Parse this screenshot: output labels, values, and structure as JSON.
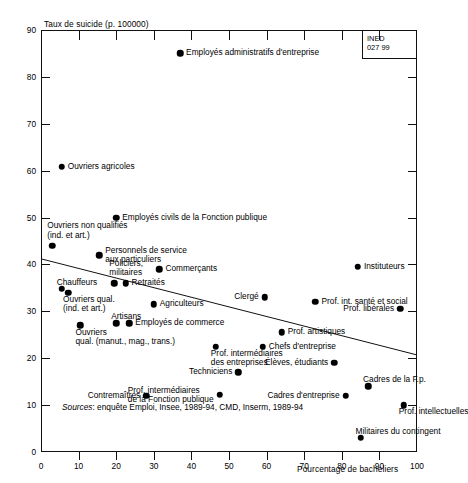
{
  "chart_data": {
    "type": "scatter",
    "title": "",
    "ylabel": "Taux de suicide (p. 100000)",
    "xlabel": "Pourcentage de bacheliers",
    "xlim": [
      0,
      100
    ],
    "ylim": [
      0,
      90
    ],
    "xticks": [
      0,
      10,
      20,
      30,
      40,
      50,
      60,
      70,
      80,
      90,
      100
    ],
    "yticks": [
      0,
      10,
      20,
      30,
      40,
      50,
      60,
      70,
      80,
      90
    ],
    "grid": false,
    "legend": null,
    "source": "Sources : enquête Emploi, Insee, 1989-94, CMD, Inserm, 1989-94",
    "source_prefix": "Sources",
    "source_rest": ": enquête Emploi, Insee, 1989-94, CMD, Inserm, 1989-94",
    "stamp": "INED\n027 99",
    "trend": {
      "x0": 0,
      "y0": 41.2,
      "x1": 100,
      "y1": 20.7
    },
    "points": [
      {
        "label": "Employés administratifs d'entreprise",
        "x": 37.0,
        "y": 85.0,
        "side": "right"
      },
      {
        "label": "Ouvriers agricoles",
        "x": 5.5,
        "y": 60.8,
        "side": "right"
      },
      {
        "label": "Employés civils de la Fonction publique",
        "x": 20.0,
        "y": 50.0,
        "side": "right"
      },
      {
        "label": "Ouvriers non qualifiés\n(ind. et art.)",
        "x": 3.0,
        "y": 44.0,
        "side": "above-left"
      },
      {
        "label": "Personnels de service\naux particuliers",
        "x": 15.5,
        "y": 42.0,
        "side": "right"
      },
      {
        "label": "Commerçants",
        "x": 31.5,
        "y": 39.0,
        "side": "right"
      },
      {
        "label": "Instituteurs",
        "x": 84.3,
        "y": 39.5,
        "side": "right"
      },
      {
        "label": "Policiers,\nmilitaires",
        "x": 19.5,
        "y": 36.0,
        "side": "above-left"
      },
      {
        "label": "Retraités",
        "x": 22.5,
        "y": 36.0,
        "side": "right"
      },
      {
        "label": "Clergé",
        "x": 59.5,
        "y": 33.0,
        "side": "left"
      },
      {
        "label": "Prof. int. santé et social",
        "x": 73.0,
        "y": 32.0,
        "side": "right"
      },
      {
        "label": "Chauffeurs",
        "x": 5.5,
        "y": 34.8,
        "side": "above-left"
      },
      {
        "label": "Ouvriers qual.\n(ind. et art.)",
        "x": 7.2,
        "y": 34.0,
        "side": "below-left"
      },
      {
        "label": "Prof. libérales",
        "x": 95.5,
        "y": 30.5,
        "side": "left"
      },
      {
        "label": "Agriculteurs",
        "x": 30.0,
        "y": 31.5,
        "side": "right"
      },
      {
        "label": "Artisans",
        "x": 20.0,
        "y": 27.5,
        "side": "above-left"
      },
      {
        "label": "Employés de commerce",
        "x": 23.5,
        "y": 27.5,
        "side": "right"
      },
      {
        "label": "Ouvriers\nqual. (manut., mag., trans.)",
        "x": 10.5,
        "y": 27.0,
        "side": "below-left"
      },
      {
        "label": "Prof. artistiques",
        "x": 64.0,
        "y": 25.5,
        "side": "right"
      },
      {
        "label": "Prof. intermédiaires\ndes entreprises",
        "x": 46.5,
        "y": 22.5,
        "side": "below"
      },
      {
        "label": "Chefs d'entreprise",
        "x": 59.0,
        "y": 22.5,
        "side": "right"
      },
      {
        "label": "Élèves, étudiants",
        "x": 78.0,
        "y": 19.0,
        "side": "left"
      },
      {
        "label": "Techniciens",
        "x": 52.5,
        "y": 17.0,
        "side": "left"
      },
      {
        "label": "Cadres de la F.p.",
        "x": 87.0,
        "y": 14.0,
        "side": "above-left"
      },
      {
        "label": "Prof. intermédiaires\nde la Fonction publique",
        "x": 47.5,
        "y": 12.2,
        "side": "left"
      },
      {
        "label": "Contremaîtres",
        "x": 28.0,
        "y": 12.0,
        "side": "left"
      },
      {
        "label": "Cadres d'entreprise",
        "x": 81.0,
        "y": 12.0,
        "side": "left"
      },
      {
        "label": "Prof. intellectuelles",
        "x": 96.5,
        "y": 10.0,
        "side": "below-left"
      },
      {
        "label": "Militaires du contingent",
        "x": 85.0,
        "y": 3.0,
        "side": "above-left"
      }
    ]
  }
}
